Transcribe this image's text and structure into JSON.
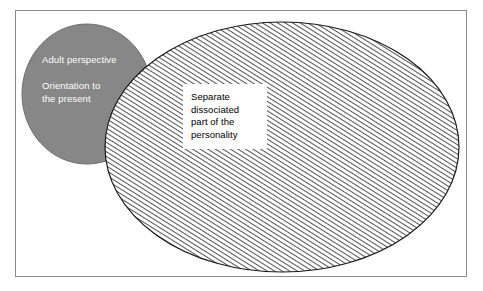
{
  "figure": {
    "kind": "venn-diagram",
    "frame": {
      "border_color": "#8a8a8a",
      "background_color": "#ffffff"
    }
  },
  "shapes": {
    "gray_ellipse": {
      "name": "adult-perspective-ellipse",
      "fill_color": "#878787",
      "stroke_color": "#6f6f6f",
      "cx": 71,
      "cy": 83,
      "rx": 65,
      "ry": 70
    },
    "hatched_ellipse": {
      "name": "dissociated-part-ellipse",
      "fill_pattern": "diagonal-hatch",
      "hatch_color": "#1a1a1a",
      "hatch_background": "#ffffff",
      "hatch_spacing_px": 4,
      "hatch_direction": "forward-slash",
      "stroke_color": "#1a1a1a",
      "cx": 266,
      "cy": 136,
      "rx": 177,
      "ry": 125
    }
  },
  "labels": {
    "adult_perspective": {
      "text": "Adult perspective",
      "color": "#ffffff"
    },
    "orientation_to_present": {
      "lines": [
        "Orientation to",
        "the present"
      ],
      "color": "#ffffff"
    },
    "dissociated_part": {
      "lines": [
        "Separate",
        "dissociated",
        "part of the",
        "personality"
      ],
      "color": "#000000",
      "background_color": "#ffffff"
    }
  }
}
